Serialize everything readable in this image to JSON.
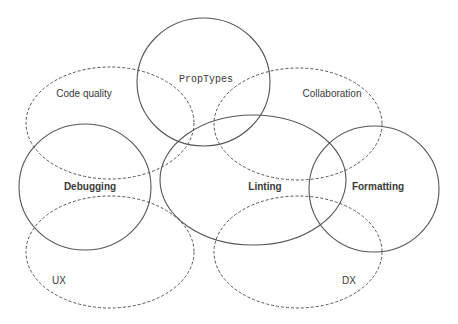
{
  "diagram": {
    "type": "venn-like overlapping ellipses",
    "stroke_color": "#555555",
    "label_color": "#3a3a3a",
    "background": "#ffffff",
    "nodes": [
      {
        "id": "proptypes",
        "label": "PropTypes",
        "style": "solid",
        "font": "mono",
        "cx": 203.5,
        "cy": 82,
        "rx": 66.5,
        "ry": 64,
        "label_x": 206,
        "label_y": 82
      },
      {
        "id": "code-quality",
        "label": "Code quality",
        "style": "dashed",
        "font": "regular",
        "cx": 110,
        "cy": 123,
        "rx": 84,
        "ry": 56,
        "label_x": 84,
        "label_y": 97
      },
      {
        "id": "collaboration",
        "label": "Collaboration",
        "style": "dashed",
        "font": "regular",
        "cx": 298,
        "cy": 124,
        "rx": 84,
        "ry": 56,
        "label_x": 332,
        "label_y": 97
      },
      {
        "id": "debugging",
        "label": "Debugging",
        "style": "solid",
        "font": "bold",
        "cx": 85,
        "cy": 187,
        "rx": 66,
        "ry": 63,
        "label_x": 90,
        "label_y": 190
      },
      {
        "id": "linting",
        "label": "Linting",
        "style": "solid",
        "font": "bold",
        "cx": 253,
        "cy": 180,
        "rx": 93,
        "ry": 65,
        "label_x": 265,
        "label_y": 190
      },
      {
        "id": "formatting",
        "label": "Formatting",
        "style": "solid",
        "font": "bold",
        "cx": 374,
        "cy": 189,
        "rx": 65,
        "ry": 63,
        "label_x": 378,
        "label_y": 190
      },
      {
        "id": "ux",
        "label": "UX",
        "style": "dashed",
        "font": "regular",
        "cx": 110,
        "cy": 252,
        "rx": 84,
        "ry": 56,
        "label_x": 59,
        "label_y": 284
      },
      {
        "id": "dx",
        "label": "DX",
        "style": "dashed",
        "font": "regular",
        "cx": 298,
        "cy": 252,
        "rx": 84,
        "ry": 56,
        "label_x": 349,
        "label_y": 284
      }
    ]
  }
}
